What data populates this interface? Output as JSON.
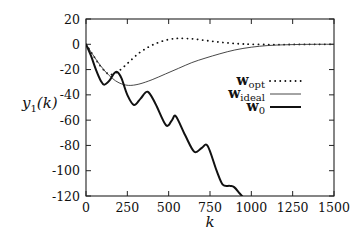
{
  "chart_data": {
    "type": "line",
    "title": "",
    "xlabel": "k",
    "ylabel": "y1(k)",
    "ylabel_main": "y",
    "ylabel_sub": "1",
    "ylabel_rest": "(k)",
    "xlim": [
      0,
      1500
    ],
    "ylim": [
      -120,
      20
    ],
    "xticks": [
      0,
      250,
      500,
      750,
      1000,
      1250,
      1500
    ],
    "xtick_labels": [
      "0",
      "250",
      "500",
      "750",
      "1000",
      "1250",
      "1500"
    ],
    "yticks": [
      20,
      0,
      -20,
      -40,
      -60,
      -80,
      -100,
      -120
    ],
    "ytick_labels": [
      "20",
      "0",
      "-20",
      "-40",
      "-60",
      "-80",
      "-100",
      "-120"
    ],
    "grid": false,
    "legend_position": "center-right",
    "series": [
      {
        "name": "w_opt",
        "label_main": "w",
        "label_sub": "opt",
        "style": "dotted",
        "color": "#111111",
        "x": [
          0,
          40,
          80,
          120,
          150,
          200,
          260,
          320,
          380,
          440,
          500,
          550,
          585,
          640,
          700,
          760,
          820,
          880,
          940,
          1000,
          1100,
          1200,
          1300,
          1400,
          1500
        ],
        "y": [
          0,
          -8,
          -16,
          -22,
          -24,
          -21,
          -14,
          -7,
          -2,
          1.5,
          3.8,
          4.6,
          4.7,
          4.3,
          3.4,
          2.4,
          1.5,
          0.8,
          0.3,
          0,
          -0.2,
          -0.2,
          -0.1,
          0,
          0
        ]
      },
      {
        "name": "w_ideal",
        "label_main": "w",
        "label_sub": "ideal",
        "style": "solid-thin",
        "color": "#333333",
        "x": [
          0,
          40,
          80,
          120,
          160,
          200,
          256,
          320,
          400,
          480,
          560,
          640,
          720,
          810,
          900,
          1000,
          1100,
          1200,
          1300,
          1400,
          1500
        ],
        "y": [
          0,
          -8,
          -15.5,
          -22,
          -27,
          -30.5,
          -32.5,
          -31.5,
          -28,
          -23.5,
          -19,
          -14.5,
          -11,
          -7.5,
          -4.5,
          -2.3,
          -1,
          -0.4,
          -0.1,
          0,
          0
        ]
      },
      {
        "name": "w_0",
        "label_main": "w",
        "label_sub": "0",
        "style": "solid-thick",
        "color": "#111111",
        "x": [
          0,
          30,
          60,
          90,
          110,
          140,
          170,
          190,
          215,
          250,
          290,
          330,
          373,
          420,
          484,
          520,
          544,
          600,
          655,
          700,
          736,
          790,
          827,
          870,
          896,
          930,
          950
        ],
        "y": [
          0,
          -9,
          -20,
          -29,
          -32,
          -29,
          -23,
          -22,
          -27,
          -40,
          -48,
          -43,
          -37.5,
          -47,
          -64,
          -60,
          -57,
          -72,
          -85,
          -82,
          -80.5,
          -100,
          -111,
          -112,
          -113,
          -118,
          -121
        ]
      }
    ]
  }
}
